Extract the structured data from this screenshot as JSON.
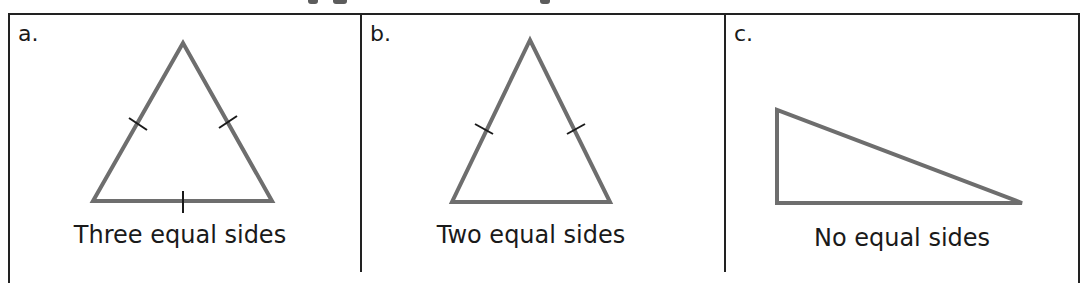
{
  "panels": [
    {
      "label": "a.",
      "caption": "Three equal sides",
      "type": "equilateral",
      "vertices": [
        [
          183,
          43
        ],
        [
          93,
          201
        ],
        [
          272,
          201
        ]
      ],
      "ticks": [
        [
          [
            129,
            118
          ],
          [
            147,
            130
          ]
        ],
        [
          [
            219,
            128
          ],
          [
            237,
            116
          ]
        ],
        [
          [
            183,
            191
          ],
          [
            183,
            213
          ]
        ]
      ]
    },
    {
      "label": "b.",
      "caption": "Two equal sides",
      "type": "isosceles",
      "vertices": [
        [
          530,
          40
        ],
        [
          452,
          202
        ],
        [
          610,
          202
        ]
      ],
      "ticks": [
        [
          [
            475,
            124
          ],
          [
            493,
            134
          ]
        ],
        [
          [
            567,
            134
          ],
          [
            585,
            124
          ]
        ]
      ]
    },
    {
      "label": "c.",
      "caption": "No equal sides",
      "type": "scalene",
      "vertices": [
        [
          777,
          110
        ],
        [
          777,
          203
        ],
        [
          1022,
          203
        ]
      ],
      "ticks": []
    }
  ],
  "colors": {
    "triangle_stroke": "#6e6e6e",
    "tick": "#1a1a1a",
    "border": "#222222"
  }
}
